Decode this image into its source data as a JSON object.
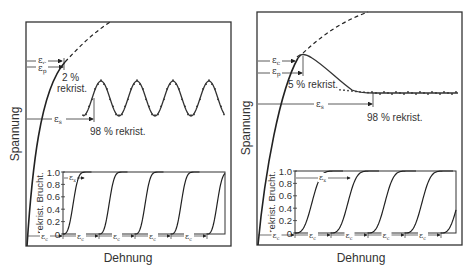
{
  "panels": [
    {
      "id": "left",
      "ylabel": "Spannung",
      "xlabel": "Dehnung",
      "annotations": {
        "eps_c": "ε",
        "eps_c_sub": "c",
        "eps_p": "ε",
        "eps_p_sub": "p",
        "eps_s": "ε",
        "eps_s_sub": "s",
        "start_label_line1": "2 %",
        "start_label_line2": "rekrist.",
        "end_label": "98 % rekrist."
      },
      "behavior": "oscillating",
      "inset": {
        "ylabel": "rekrist. Bruchteil",
        "ylabel_display": "rekrist. Brucht.",
        "yticks": [
          "1.0",
          "0.8",
          "0.6",
          "0.4",
          "0.2",
          "0"
        ],
        "eps_x": "ε",
        "eps_x_sub": "x",
        "interval_label": "ε",
        "interval_sub": "c",
        "interval_count": 5
      }
    },
    {
      "id": "right",
      "ylabel": "Spannung",
      "xlabel": "Dehnung",
      "annotations": {
        "eps_c": "ε",
        "eps_c_sub": "c",
        "eps_p": "ε",
        "eps_p_sub": "p",
        "eps_s": "ε",
        "eps_s_sub": "s",
        "start_label": "5 % rekrist.",
        "end_label": "98 % rekrist."
      },
      "behavior": "single-peak",
      "inset": {
        "ylabel": "rekrist. Bruchteil",
        "ylabel_display": "rekrist. Brucht.",
        "yticks": [
          "1.0",
          "0.8",
          "0.6",
          "0.4",
          "0.2",
          "0"
        ],
        "eps_x": "ε",
        "eps_x_sub": "x",
        "interval_label": "ε",
        "interval_sub": "c",
        "interval_count": 5
      }
    }
  ]
}
